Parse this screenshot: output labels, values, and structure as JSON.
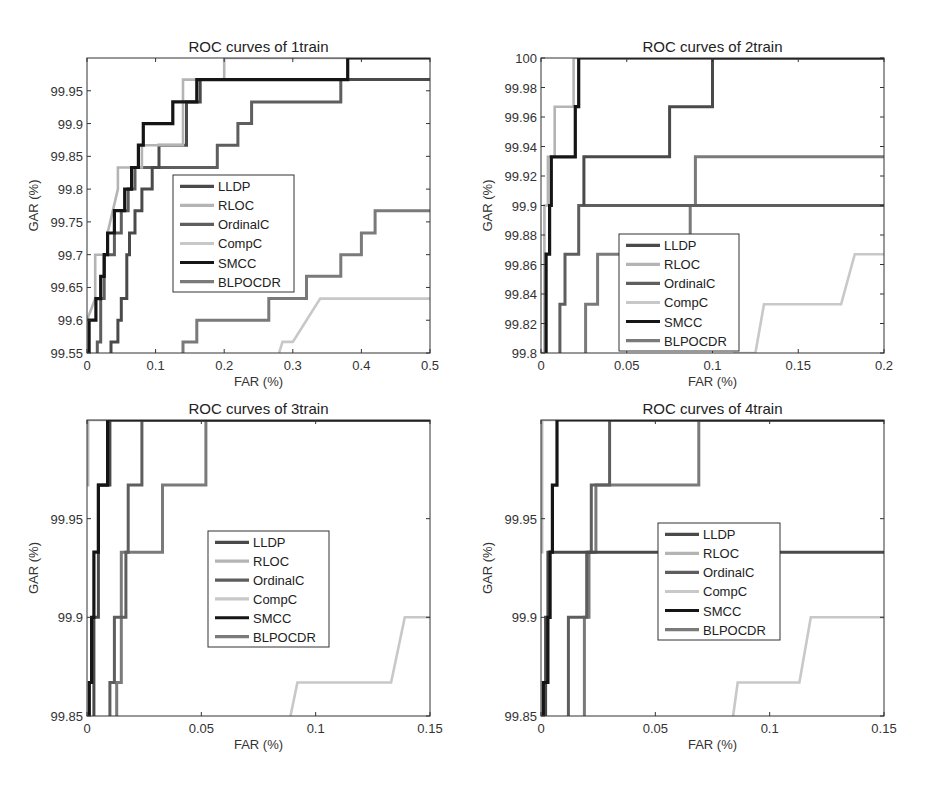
{
  "legend_items": [
    "LLDP",
    "RLOC",
    "OrdinalC",
    "CompC",
    "SMCC",
    "BLPOCDR"
  ],
  "colors": {
    "LLDP": "#4a4a4a",
    "RLOC": "#b4b4b4",
    "OrdinalC": "#5e5e5e",
    "CompC": "#c8c8c8",
    "SMCC": "#151515",
    "BLPOCDR": "#7a7a7a"
  },
  "chart_data": [
    {
      "type": "line",
      "title": "ROC curves of 1train",
      "xlabel": "FAR (%)",
      "ylabel": "GAR (%)",
      "xlim": [
        0,
        0.5
      ],
      "ylim": [
        99.55,
        100
      ],
      "xticks": [
        "0",
        "0.1",
        "0.2",
        "0.3",
        "0.4",
        "0.5"
      ],
      "xtick_values": [
        0,
        0.1,
        0.2,
        0.3,
        0.4,
        0.5
      ],
      "yticks": [
        "99.55",
        "99.6",
        "99.65",
        "99.7",
        "99.75",
        "99.8",
        "99.85",
        "99.9",
        "99.95"
      ],
      "ytick_values": [
        99.55,
        99.6,
        99.65,
        99.7,
        99.75,
        99.8,
        99.85,
        99.9,
        99.95
      ],
      "legend_position": "center",
      "box": {
        "left": 87,
        "top": 58,
        "right": 430,
        "bottom": 353
      },
      "legend_box": {
        "x": 173,
        "y": 175,
        "w": 121,
        "h": 117
      },
      "series": [
        {
          "name": "SMCC",
          "x": [
            0,
            0.003,
            0.003,
            0.013,
            0.013,
            0.02,
            0.02,
            0.025,
            0.025,
            0.03,
            0.03,
            0.04,
            0.04,
            0.055,
            0.055,
            0.065,
            0.065,
            0.075,
            0.075,
            0.082,
            0.082,
            0.098,
            0.098,
            0.125,
            0.125,
            0.16,
            0.16,
            0.38,
            0.38,
            0.5
          ],
          "y": [
            99.55,
            99.55,
            99.6,
            99.6,
            99.633,
            99.633,
            99.667,
            99.667,
            99.7,
            99.7,
            99.733,
            99.733,
            99.767,
            99.767,
            99.8,
            99.8,
            99.833,
            99.833,
            99.867,
            99.867,
            99.9,
            99.9,
            99.9,
            99.9,
            99.933,
            99.933,
            99.967,
            99.967,
            100,
            100
          ]
        },
        {
          "name": "LLDP",
          "x": [
            0.035,
            0.035,
            0.045,
            0.045,
            0.05,
            0.05,
            0.058,
            0.058,
            0.062,
            0.062,
            0.07,
            0.07,
            0.08,
            0.08,
            0.095,
            0.095,
            0.105,
            0.105,
            0.145,
            0.145,
            0.165,
            0.165,
            0.5
          ],
          "y": [
            99.55,
            99.567,
            99.567,
            99.6,
            99.6,
            99.633,
            99.633,
            99.7,
            99.7,
            99.733,
            99.733,
            99.767,
            99.767,
            99.8,
            99.8,
            99.833,
            99.833,
            99.867,
            99.867,
            99.933,
            99.933,
            99.967,
            99.967
          ]
        },
        {
          "name": "RLOC",
          "x": [
            0,
            0.012,
            0.012,
            0.03,
            0.03,
            0.045,
            0.045,
            0.08,
            0.08,
            0.085,
            0.085,
            0.14,
            0.14,
            0.2,
            0.2,
            0.5
          ],
          "y": [
            99.6,
            99.633,
            99.7,
            99.7,
            99.733,
            99.8,
            99.833,
            99.833,
            99.867,
            99.867,
            99.867,
            99.867,
            99.967,
            99.967,
            100,
            100
          ]
        },
        {
          "name": "OrdinalC",
          "x": [
            0.015,
            0.015,
            0.02,
            0.02,
            0.025,
            0.025,
            0.04,
            0.04,
            0.05,
            0.05,
            0.06,
            0.06,
            0.07,
            0.07,
            0.1,
            0.1,
            0.11,
            0.11,
            0.19,
            0.19,
            0.22,
            0.22,
            0.24,
            0.24,
            0.37,
            0.37,
            0.5
          ],
          "y": [
            99.55,
            99.567,
            99.567,
            99.633,
            99.633,
            99.7,
            99.7,
            99.733,
            99.733,
            99.767,
            99.767,
            99.8,
            99.8,
            99.833,
            99.833,
            99.833,
            99.833,
            99.833,
            99.833,
            99.867,
            99.867,
            99.9,
            99.9,
            99.933,
            99.933,
            99.967,
            99.967
          ]
        },
        {
          "name": "CompC",
          "x": [
            0.28,
            0.285,
            0.285,
            0.3,
            0.3,
            0.34,
            0.34,
            0.5
          ],
          "y": [
            99.55,
            99.567,
            99.567,
            99.567,
            99.567,
            99.633,
            99.633,
            99.633
          ]
        },
        {
          "name": "BLPOCDR",
          "x": [
            0.14,
            0.14,
            0.15,
            0.15,
            0.16,
            0.16,
            0.265,
            0.265,
            0.32,
            0.32,
            0.37,
            0.37,
            0.4,
            0.4,
            0.42,
            0.42,
            0.43,
            0.43,
            0.5
          ],
          "y": [
            99.55,
            99.567,
            99.567,
            99.567,
            99.567,
            99.6,
            99.6,
            99.633,
            99.633,
            99.667,
            99.667,
            99.7,
            99.7,
            99.733,
            99.733,
            99.767,
            99.767,
            99.767,
            99.767
          ]
        }
      ]
    },
    {
      "type": "line",
      "title": "ROC curves of 2train",
      "xlabel": "FAR (%)",
      "ylabel": "GAR (%)",
      "xlim": [
        0,
        0.2
      ],
      "ylim": [
        99.8,
        100
      ],
      "xticks": [
        "0",
        "0.05",
        "0.1",
        "0.15",
        "0.2"
      ],
      "xtick_values": [
        0,
        0.05,
        0.1,
        0.15,
        0.2
      ],
      "yticks": [
        "99.8",
        "99.82",
        "99.84",
        "99.86",
        "99.88",
        "99.9",
        "99.92",
        "99.94",
        "99.96",
        "99.98",
        "100"
      ],
      "ytick_values": [
        99.8,
        99.82,
        99.84,
        99.86,
        99.88,
        99.9,
        99.92,
        99.94,
        99.96,
        99.98,
        100
      ],
      "legend_position": "lower-center",
      "box": {
        "left": 541,
        "top": 58,
        "right": 884,
        "bottom": 353
      },
      "legend_box": {
        "x": 619,
        "y": 234,
        "w": 120,
        "h": 117
      },
      "series": [
        {
          "name": "SMCC",
          "x": [
            0.003,
            0.003,
            0.005,
            0.005,
            0.006,
            0.006,
            0.02,
            0.02,
            0.022,
            0.022,
            0.2
          ],
          "y": [
            99.8,
            99.867,
            99.867,
            99.9,
            99.9,
            99.933,
            99.933,
            99.967,
            99.967,
            100,
            100
          ]
        },
        {
          "name": "RLOC",
          "x": [
            0,
            0.002,
            0.002,
            0.004,
            0.004,
            0.008,
            0.008,
            0.019,
            0.019,
            0.2
          ],
          "y": [
            99.8,
            99.8,
            99.9,
            99.9,
            99.933,
            99.933,
            99.967,
            99.967,
            100,
            100
          ]
        },
        {
          "name": "LLDP",
          "x": [
            0.025,
            0.025,
            0.075,
            0.075,
            0.1,
            0.1,
            0.2
          ],
          "y": [
            99.9,
            99.933,
            99.933,
            99.967,
            99.967,
            100,
            100
          ]
        },
        {
          "name": "OrdinalC",
          "x": [
            0.011,
            0.011,
            0.014,
            0.014,
            0.022,
            0.022,
            0.025,
            0.025,
            0.2
          ],
          "y": [
            99.8,
            99.833,
            99.833,
            99.867,
            99.867,
            99.9,
            99.9,
            99.9,
            99.9
          ]
        },
        {
          "name": "BLPOCDR",
          "x": [
            0.026,
            0.026,
            0.033,
            0.033,
            0.087,
            0.087,
            0.09,
            0.09,
            0.2
          ],
          "y": [
            99.8,
            99.833,
            99.833,
            99.867,
            99.867,
            99.9,
            99.9,
            99.933,
            99.933
          ]
        },
        {
          "name": "CompC",
          "x": [
            0.112,
            0.125,
            0.13,
            0.175,
            0.183,
            0.2
          ],
          "y": [
            99.8,
            99.8,
            99.833,
            99.833,
            99.867,
            99.867
          ]
        }
      ]
    },
    {
      "type": "line",
      "title": "ROC curves of 3train",
      "xlabel": "FAR (%)",
      "ylabel": "GAR (%)",
      "xlim": [
        0,
        0.15
      ],
      "ylim": [
        99.85,
        100
      ],
      "xticks": [
        "0",
        "0.05",
        "0.1",
        "0.15"
      ],
      "xtick_values": [
        0,
        0.05,
        0.1,
        0.15
      ],
      "yticks": [
        "99.85",
        "99.9",
        "99.95"
      ],
      "ytick_values": [
        99.85,
        99.9,
        99.95
      ],
      "legend_position": "center",
      "box": {
        "left": 87,
        "top": 420,
        "right": 430,
        "bottom": 716
      },
      "legend_box": {
        "x": 208,
        "y": 531,
        "w": 121,
        "h": 116
      },
      "series": [
        {
          "name": "RLOC",
          "x": [
            0,
            0.0005,
            0.0005,
            0.15
          ],
          "y": [
            99.967,
            99.967,
            100,
            100
          ]
        },
        {
          "name": "SMCC",
          "x": [
            0.001,
            0.001,
            0.002,
            0.002,
            0.003,
            0.003,
            0.005,
            0.005,
            0.007,
            0.007,
            0.009,
            0.009,
            0.15
          ],
          "y": [
            99.85,
            99.867,
            99.867,
            99.9,
            99.9,
            99.933,
            99.933,
            99.967,
            99.967,
            99.967,
            99.967,
            100,
            100
          ]
        },
        {
          "name": "LLDP",
          "x": [
            0.003,
            0.003,
            0.005,
            0.005,
            0.01,
            0.01,
            0.15
          ],
          "y": [
            99.85,
            99.9,
            99.9,
            99.967,
            99.967,
            100,
            100
          ]
        },
        {
          "name": "OrdinalC",
          "x": [
            0.01,
            0.01,
            0.012,
            0.012,
            0.017,
            0.017,
            0.018,
            0.018,
            0.024,
            0.024,
            0.15
          ],
          "y": [
            99.85,
            99.867,
            99.867,
            99.9,
            99.9,
            99.933,
            99.933,
            99.967,
            99.967,
            100,
            100
          ]
        },
        {
          "name": "BLPOCDR",
          "x": [
            0.013,
            0.013,
            0.015,
            0.015,
            0.033,
            0.033,
            0.052,
            0.052,
            0.15
          ],
          "y": [
            99.85,
            99.867,
            99.867,
            99.933,
            99.933,
            99.967,
            99.967,
            100,
            100
          ]
        },
        {
          "name": "CompC",
          "x": [
            0.089,
            0.092,
            0.133,
            0.139,
            0.15
          ],
          "y": [
            99.85,
            99.867,
            99.867,
            99.9,
            99.9
          ]
        }
      ]
    },
    {
      "type": "line",
      "title": "ROC curves of 4train",
      "xlabel": "FAR (%)",
      "ylabel": "GAR (%)",
      "xlim": [
        0,
        0.15
      ],
      "ylim": [
        99.85,
        100
      ],
      "xticks": [
        "0",
        "0.05",
        "0.1",
        "0.15"
      ],
      "xtick_values": [
        0,
        0.05,
        0.1,
        0.15
      ],
      "yticks": [
        "99.85",
        "99.9",
        "99.95"
      ],
      "ytick_values": [
        99.85,
        99.9,
        99.95
      ],
      "legend_position": "center",
      "box": {
        "left": 541,
        "top": 420,
        "right": 884,
        "bottom": 716
      },
      "legend_box": {
        "x": 658,
        "y": 523,
        "w": 122,
        "h": 117
      },
      "series": [
        {
          "name": "RLOC",
          "x": [
            0,
            0.0005,
            0.0005,
            0.15
          ],
          "y": [
            99.933,
            99.933,
            100,
            100
          ]
        },
        {
          "name": "LLDP",
          "x": [
            0.002,
            0.002,
            0.003,
            0.003,
            0.15
          ],
          "y": [
            99.85,
            99.9,
            99.9,
            99.933,
            99.933
          ]
        },
        {
          "name": "SMCC",
          "x": [
            0.001,
            0.001,
            0.003,
            0.003,
            0.004,
            0.004,
            0.005,
            0.005,
            0.007,
            0.007,
            0.15
          ],
          "y": [
            99.85,
            99.867,
            99.867,
            99.9,
            99.9,
            99.933,
            99.933,
            99.967,
            99.967,
            100,
            100
          ]
        },
        {
          "name": "OrdinalC",
          "x": [
            0.012,
            0.012,
            0.02,
            0.02,
            0.022,
            0.022,
            0.03,
            0.03,
            0.15
          ],
          "y": [
            99.85,
            99.9,
            99.9,
            99.933,
            99.933,
            99.967,
            99.967,
            100,
            100
          ]
        },
        {
          "name": "BLPOCDR",
          "x": [
            0.019,
            0.019,
            0.021,
            0.021,
            0.024,
            0.024,
            0.069,
            0.069,
            0.15
          ],
          "y": [
            99.85,
            99.9,
            99.9,
            99.933,
            99.933,
            99.967,
            99.967,
            100,
            100
          ]
        },
        {
          "name": "CompC",
          "x": [
            0.084,
            0.086,
            0.113,
            0.118,
            0.15
          ],
          "y": [
            99.85,
            99.867,
            99.867,
            99.9,
            99.9
          ]
        }
      ]
    }
  ]
}
